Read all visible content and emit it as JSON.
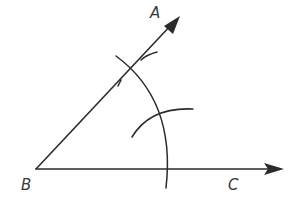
{
  "diagram": {
    "title": "",
    "type": "angle-bisector-construction",
    "stroke_color": "#2b2b2b",
    "points": {
      "A": {
        "label": "A"
      },
      "B": {
        "label": "B"
      },
      "C": {
        "label": "C"
      }
    },
    "rays": [
      {
        "from": "B",
        "to": "A",
        "arrow": true
      },
      {
        "from": "B",
        "to": "C",
        "arrow": true
      }
    ],
    "arcs": [
      {
        "name": "arc-centered-at-B",
        "description": "large compass arc centered at B crossing both rays"
      },
      {
        "name": "arc-intersection",
        "description": "small compass arc in the interior of the angle"
      },
      {
        "name": "arc-mark-on-BA",
        "description": "small arc mark near the intersection on ray BA"
      }
    ]
  }
}
